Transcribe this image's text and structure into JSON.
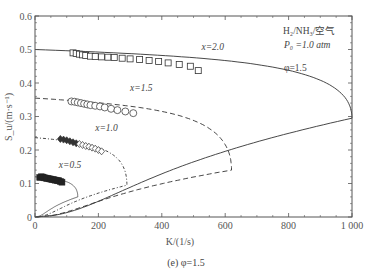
{
  "chart_data": {
    "type": "line",
    "title": "",
    "caption": "(e) φ=1.5",
    "xlabel": "K/(1/s)",
    "ylabel": "S_u/(m·s⁻¹)",
    "xlim": [
      0,
      1000
    ],
    "ylim": [
      0,
      0.6
    ],
    "x_ticks": [
      0,
      200,
      400,
      600,
      800,
      1000
    ],
    "x_tick_labels": [
      "0",
      "200",
      "400",
      "600",
      "800",
      "1 000"
    ],
    "y_ticks": [
      0,
      0.1,
      0.2,
      0.3,
      0.4,
      0.5,
      0.6
    ],
    "y_tick_labels": [
      "0",
      "0.1",
      "0.2",
      "0.3",
      "0.4",
      "0.5",
      "0.6"
    ],
    "grid": false,
    "annotations": {
      "mixture": "H₂/NH₃/空气",
      "pressure": "P₀ =1.0 atm",
      "equivalence_ratio": "φ=1.5"
    },
    "series": [
      {
        "name": "x=2.0",
        "style": "solid",
        "marker": "square",
        "curve": {
          "S0": 0.5,
          "K_ext": 1000,
          "S_ext": 0.295
        },
        "points_K": [
          120,
          130,
          140,
          150,
          160,
          175,
          190,
          210,
          230,
          250,
          275,
          300,
          330,
          360,
          390,
          420,
          455,
          490,
          515
        ],
        "points_S": [
          0.49,
          0.488,
          0.486,
          0.484,
          0.482,
          0.48,
          0.479,
          0.478,
          0.477,
          0.476,
          0.474,
          0.472,
          0.47,
          0.467,
          0.464,
          0.46,
          0.455,
          0.45,
          0.437
        ]
      },
      {
        "name": "x=1.5",
        "style": "dashed",
        "marker": "circle",
        "curve": {
          "S0": 0.355,
          "K_ext": 620,
          "S_ext": 0.14
        },
        "points_K": [
          115,
          125,
          135,
          145,
          155,
          165,
          175,
          190,
          205,
          220,
          240,
          260,
          285,
          310
        ],
        "points_S": [
          0.345,
          0.344,
          0.342,
          0.34,
          0.338,
          0.336,
          0.334,
          0.332,
          0.33,
          0.327,
          0.323,
          0.319,
          0.315,
          0.31
        ]
      },
      {
        "name": "x=1.0",
        "style": "dash-dot",
        "marker": "diamond",
        "curve": {
          "S0": 0.237,
          "K_ext": 290,
          "S_ext": 0.095
        },
        "points_K": [
          80,
          90,
          100,
          110,
          120,
          130,
          140,
          150,
          160,
          170,
          180,
          190,
          200,
          210
        ],
        "points_S": [
          0.233,
          0.231,
          0.229,
          0.226,
          0.223,
          0.22,
          0.218,
          0.215,
          0.212,
          0.21,
          0.207,
          0.204,
          0.2,
          0.196
        ]
      },
      {
        "name": "x=0.5",
        "style": "solid-thin",
        "marker": "filled",
        "curve": {
          "S0": 0.12,
          "K_ext": 135,
          "S_ext": 0.06
        },
        "points_K": [
          15,
          20,
          25,
          30,
          35,
          40,
          45,
          50,
          55,
          60,
          65,
          70,
          75,
          80,
          85
        ],
        "points_S": [
          0.118,
          0.12,
          0.119,
          0.117,
          0.116,
          0.115,
          0.114,
          0.113,
          0.112,
          0.111,
          0.11,
          0.109,
          0.108,
          0.106,
          0.104
        ]
      }
    ]
  },
  "labels": {
    "series_labels": [
      {
        "text": "x=2.0",
        "K": 525,
        "S": 0.5
      },
      {
        "text": "x=1.5",
        "K": 300,
        "S": 0.375
      },
      {
        "text": "x=1.0",
        "K": 190,
        "S": 0.257
      },
      {
        "text": "x=0.5",
        "K": 75,
        "S": 0.145
      }
    ]
  }
}
